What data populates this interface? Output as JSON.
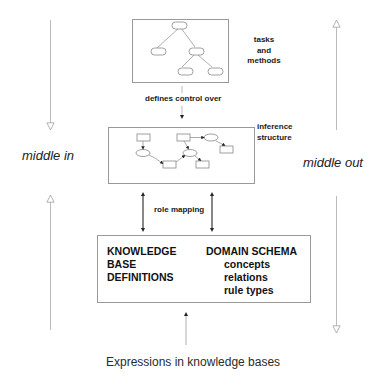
{
  "layers": {
    "task": {
      "label_lines": [
        "tasks",
        "and",
        "methods"
      ]
    },
    "inference": {
      "label_lines": [
        "inference",
        "structure"
      ]
    },
    "domain": {
      "left_lines": [
        "KNOWLEDGE",
        "BASE",
        "DEFINITIONS"
      ],
      "right_title": "DOMAIN SCHEMA",
      "right_items": [
        "concepts",
        "relations",
        "rule types"
      ]
    }
  },
  "connectors": {
    "task_to_inference": "defines control over",
    "inference_to_domain": "role mapping"
  },
  "sides": {
    "left": "middle in",
    "right": "middle out"
  },
  "caption": "Expressions in knowledge bases"
}
